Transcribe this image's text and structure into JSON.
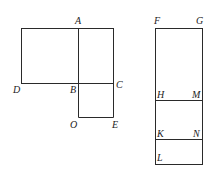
{
  "figure": {
    "left_diagram": {
      "labels": {
        "A": "A",
        "B": "B",
        "C": "C",
        "D": "D",
        "O": "O",
        "E": "E"
      }
    },
    "right_diagram": {
      "labels": {
        "F": "F",
        "G": "G",
        "H": "H",
        "M": "M",
        "K": "K",
        "N": "N",
        "L": "L"
      }
    },
    "stroke_color": "#2a2a2a"
  }
}
